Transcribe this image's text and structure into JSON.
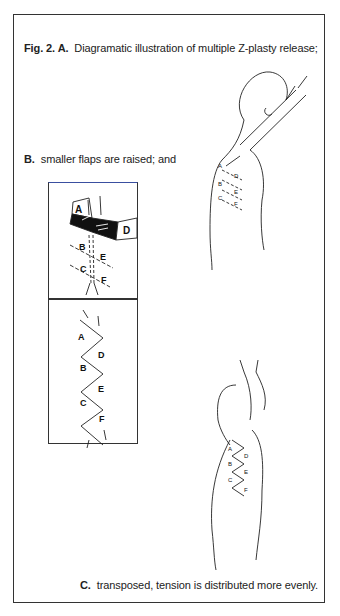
{
  "figure": {
    "caption_a": {
      "label": "Fig. 2. A.",
      "text": "Diagramatic illustration of multiple Z-plasty release;"
    },
    "caption_b": {
      "label": "B.",
      "text": "smaller flaps are raised; and"
    },
    "caption_c": {
      "label": "C.",
      "text": "transposed, tension is distributed more evenly."
    },
    "inset_top_labels": [
      "A",
      "B",
      "C",
      "D",
      "E",
      "F"
    ],
    "inset_bottom_labels": [
      "A",
      "B",
      "C",
      "D",
      "E",
      "F"
    ],
    "figure_upper_labels": [
      "A",
      "B",
      "C",
      "D",
      "E",
      "F"
    ],
    "figure_lower_labels": [
      "A",
      "B",
      "C",
      "D",
      "E",
      "F"
    ]
  }
}
